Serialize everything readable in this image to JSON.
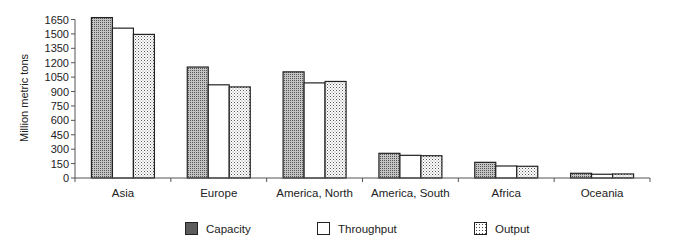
{
  "chart_data": {
    "type": "bar",
    "title": "",
    "xlabel": "",
    "ylabel": "Million metric tons",
    "ylim": [
      0,
      1650
    ],
    "yticks": [
      0,
      150,
      300,
      450,
      600,
      750,
      900,
      1050,
      1200,
      1350,
      1500,
      1650
    ],
    "grid": false,
    "legend_position": "bottom",
    "categories": [
      "Asia",
      "Europe",
      "America, North",
      "America, South",
      "Africa",
      "Oceania"
    ],
    "series": [
      {
        "name": "Capacity",
        "pattern": "dense-dots",
        "values": [
          1670,
          1155,
          1105,
          257,
          163,
          49
        ]
      },
      {
        "name": "Throughput",
        "pattern": "white",
        "values": [
          1560,
          970,
          990,
          236,
          125,
          39
        ]
      },
      {
        "name": "Output",
        "pattern": "sparse-dots",
        "values": [
          1495,
          948,
          1005,
          232,
          122,
          42
        ]
      }
    ]
  },
  "legend": {
    "items": [
      {
        "label": "Capacity"
      },
      {
        "label": "Throughput"
      },
      {
        "label": "Output"
      }
    ]
  },
  "colors": {
    "axis": "#555555",
    "bar_outline": "#222222",
    "capacity_fill": "#bbbbbb",
    "throughput_fill": "#ffffff",
    "output_fill": "#ffffff"
  }
}
